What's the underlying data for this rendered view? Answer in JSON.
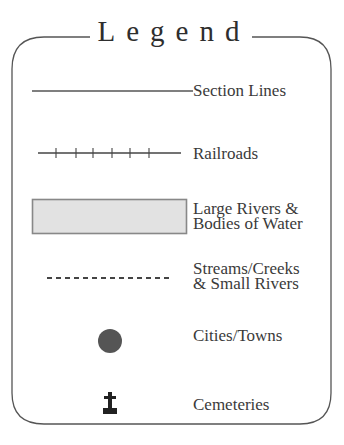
{
  "legend": {
    "title": "Legend",
    "items": [
      {
        "label_lines": [
          "Section Lines"
        ],
        "symbol": "solid-line"
      },
      {
        "label_lines": [
          "Railroads"
        ],
        "symbol": "railroad-line"
      },
      {
        "label_lines": [
          "Large Rivers &",
          "Bodies of Water"
        ],
        "symbol": "filled-rectangle"
      },
      {
        "label_lines": [
          "Streams/Creeks",
          "& Small Rivers"
        ],
        "symbol": "dashed-line"
      },
      {
        "label_lines": [
          "Cities/Towns"
        ],
        "symbol": "filled-circle"
      },
      {
        "label_lines": [
          "Cemeteries"
        ],
        "symbol": "cross-headstone"
      }
    ]
  },
  "colors": {
    "border": "#555555",
    "water_fill": "#e2e2e2",
    "water_stroke": "#888888",
    "city_dot": "#555555",
    "text": "#3a3a3a"
  }
}
